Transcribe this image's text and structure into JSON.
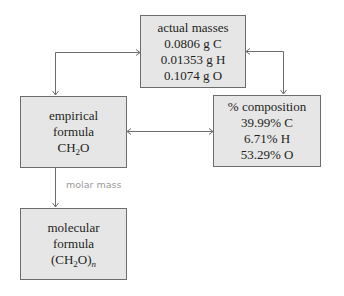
{
  "diagram": {
    "nodes": {
      "actual_masses": {
        "title": "actual masses",
        "lines": [
          "0.0806 g C",
          "0.01353 g H",
          "0.1074 g O"
        ]
      },
      "empirical_formula": {
        "title_line1": "empirical",
        "title_line2": "formula",
        "formula": {
          "pre": "CH",
          "sub": "2",
          "post": "O"
        }
      },
      "percent_composition": {
        "title": "% composition",
        "lines": [
          "39.99% C",
          "6.71% H",
          "53.29% O"
        ]
      },
      "molecular_formula": {
        "title_line1": "molecular",
        "title_line2": "formula",
        "formula": {
          "pre": "(CH",
          "sub": "2",
          "post": "O)",
          "outer_sub": "n"
        }
      }
    },
    "edges": [
      {
        "from": "actual_masses",
        "to": "empirical_formula",
        "bidirectional": true,
        "label": ""
      },
      {
        "from": "actual_masses",
        "to": "percent_composition",
        "bidirectional": true,
        "label": ""
      },
      {
        "from": "empirical_formula",
        "to": "percent_composition",
        "bidirectional": true,
        "label": ""
      },
      {
        "from": "empirical_formula",
        "to": "molecular_formula",
        "bidirectional": false,
        "label": "molar mass"
      }
    ],
    "colors": {
      "box_fill": "#e6e6e6",
      "box_border": "#6d6d6d",
      "connector": "#6d6d6d",
      "edge_label": "#9a9a9a",
      "text": "#231f20"
    }
  }
}
